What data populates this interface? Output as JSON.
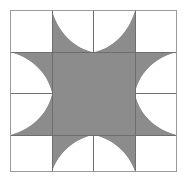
{
  "figure": {
    "type": "geometric-quilt-block",
    "canvas": {
      "width": 187,
      "height": 182
    }
  },
  "colors": {
    "background": "#ffffff",
    "patch_fill": "#8c8c8c",
    "patch_light": "#ffffff",
    "grid_line": "#6e6e6e",
    "outer_border": "#9a9a9a"
  },
  "geometry": {
    "block_left": 10,
    "block_top": 10,
    "block_right": 177,
    "block_bottom": 172,
    "grid_x": [
      10,
      52,
      93.5,
      135,
      177
    ],
    "grid_y": [
      10,
      52,
      91,
      135,
      172
    ],
    "center_square": {
      "x": 52,
      "y": 52,
      "width": 83,
      "height": 83
    },
    "cells_across": 4,
    "cells_down": 4,
    "petal_count": 4,
    "corner_count": 4
  },
  "chart_data": {
    "type": "table",
    "categories": [
      "center-square",
      "north-petal",
      "east-petal",
      "south-petal",
      "west-petal",
      "corner-blocks"
    ],
    "values": [
      1,
      1,
      1,
      1,
      1,
      4
    ]
  },
  "parts": {
    "center": {
      "label": "center-square",
      "fill": "#8c8c8c"
    },
    "petal_north": {
      "label": "north-petal",
      "fill": "#8c8c8c"
    },
    "petal_east": {
      "label": "east-petal",
      "fill": "#8c8c8c"
    },
    "petal_south": {
      "label": "south-petal",
      "fill": "#8c8c8c"
    },
    "petal_west": {
      "label": "west-petal",
      "fill": "#8c8c8c"
    },
    "corner_nw": {
      "label": "corner-northwest",
      "fill": "#ffffff"
    },
    "corner_ne": {
      "label": "corner-northeast",
      "fill": "#ffffff"
    },
    "corner_se": {
      "label": "corner-southeast",
      "fill": "#ffffff"
    },
    "corner_sw": {
      "label": "corner-southwest",
      "fill": "#ffffff"
    }
  }
}
